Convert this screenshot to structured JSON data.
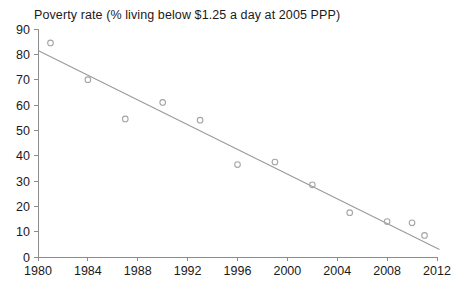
{
  "chart_data": {
    "type": "scatter",
    "title": "Poverty rate (% living below $1.25 a day at 2005 PPP)",
    "xlabel": "",
    "ylabel": "",
    "xlim": [
      1980,
      2012
    ],
    "ylim": [
      0,
      90
    ],
    "grid": false,
    "legend": null,
    "x_ticks": [
      1980,
      1984,
      1988,
      1992,
      1996,
      2000,
      2004,
      2008,
      2012
    ],
    "y_ticks": [
      0,
      10,
      20,
      30,
      40,
      50,
      60,
      70,
      80,
      90
    ],
    "x": [
      1981,
      1984,
      1987,
      1990,
      1993,
      1996,
      1999,
      2002,
      2005,
      2008,
      2010,
      2011
    ],
    "y": [
      84.5,
      70,
      54.5,
      61,
      54,
      36.5,
      37.5,
      28.5,
      17.5,
      14,
      13.5,
      8.5
    ],
    "points": [
      {
        "x": 1981,
        "y": 84.5
      },
      {
        "x": 1984,
        "y": 70
      },
      {
        "x": 1987,
        "y": 54.5
      },
      {
        "x": 1990,
        "y": 61
      },
      {
        "x": 1993,
        "y": 54
      },
      {
        "x": 1996,
        "y": 36.5
      },
      {
        "x": 1999,
        "y": 37.5
      },
      {
        "x": 2002,
        "y": 28.5
      },
      {
        "x": 2005,
        "y": 17.5
      },
      {
        "x": 2008,
        "y": 14
      },
      {
        "x": 2010,
        "y": 13.5
      },
      {
        "x": 2011,
        "y": 8.5
      }
    ],
    "trendline": {
      "type": "linear",
      "x_start": 1980,
      "y_start": 81.5,
      "x_end": 2012.2,
      "y_end": 3.0
    },
    "series": [
      {
        "name": "Poverty rate",
        "values": [
          84.5,
          70,
          54.5,
          61,
          54,
          36.5,
          37.5,
          28.5,
          17.5,
          14,
          13.5,
          8.5
        ]
      }
    ],
    "marker": "open-circle",
    "marker_color": "#a5a5a5",
    "trend_color": "#9a9a9a",
    "axis_color": "#8c8c8c",
    "text_color": "#1a1a1a"
  }
}
